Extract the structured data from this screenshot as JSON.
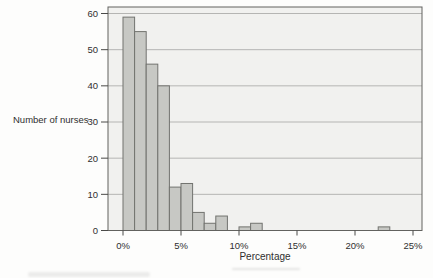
{
  "chart_data": {
    "type": "bar",
    "subtype": "histogram",
    "title": "",
    "xlabel": "Percentage",
    "ylabel": "Number of nurses",
    "x_tick_labels": [
      "0%",
      "5%",
      "10%",
      "15%",
      "20%",
      "25%"
    ],
    "x_tick_values": [
      0,
      5,
      10,
      15,
      20,
      25
    ],
    "y_tick_labels": [
      "0",
      "10",
      "20",
      "30",
      "40",
      "50",
      "60"
    ],
    "y_tick_values": [
      0,
      10,
      20,
      30,
      40,
      50,
      60
    ],
    "xlim": [
      -1.3,
      25.8
    ],
    "ylim": [
      0,
      61.8
    ],
    "grid": "horizontal",
    "bin_width_percent": 1,
    "bin_starts": [
      0,
      1,
      2,
      3,
      4,
      5,
      6,
      7,
      8,
      9,
      10,
      11,
      12,
      13,
      14,
      15,
      16,
      17,
      18,
      19,
      20,
      21,
      22,
      23,
      24
    ],
    "counts": [
      59,
      55,
      46,
      40,
      12,
      13,
      5,
      2,
      4,
      0,
      1,
      2,
      0,
      0,
      0,
      0,
      0,
      0,
      0,
      0,
      0,
      0,
      1,
      0,
      0
    ],
    "colors": {
      "bar_fill": "#c7c8c4",
      "bar_border": "#72736f",
      "plot_bg": "#f1f1ef",
      "grid": "#b5b5b3",
      "frame": "#62625f",
      "tick": "#4a4a48",
      "text": "#2f2f2f"
    }
  }
}
